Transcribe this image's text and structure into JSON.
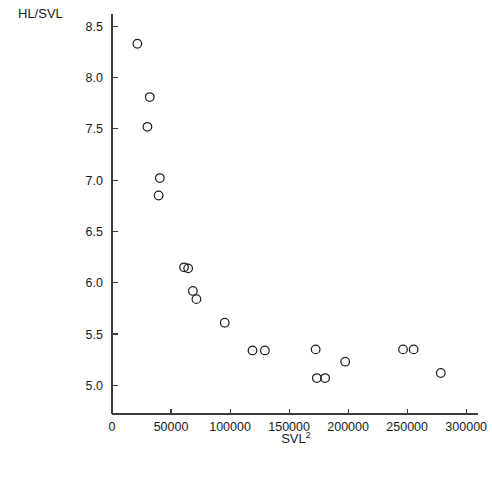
{
  "figure": {
    "background": "#ffffff",
    "ink_color": "#1f1f1f",
    "axis_color": "#3c3c3c"
  },
  "labels": {
    "y_axis_title": "HL/SVL",
    "x_axis_title_base": "SVL",
    "x_axis_title_exponent": "2"
  },
  "chart_data": {
    "type": "scatter",
    "title": "",
    "xlabel": "SVL2",
    "ylabel": "HL/SVL",
    "xlim": [
      0,
      310000
    ],
    "ylim": [
      4.72,
      8.62
    ],
    "grid": false,
    "legend": null,
    "marker": {
      "shape": "open-circle",
      "radius_px": 4.3,
      "fill": "none",
      "stroke": "#1f1f1f"
    },
    "xticks": [
      0,
      50000,
      100000,
      150000,
      200000,
      250000,
      300000
    ],
    "xtick_labels": [
      "0",
      "50000",
      "100000",
      "150000",
      "200000",
      "250000",
      "300000"
    ],
    "yticks": [
      5.0,
      5.5,
      6.0,
      6.5,
      7.0,
      7.5,
      8.0,
      8.5
    ],
    "ytick_labels": [
      "5.0",
      "5.5",
      "6.0",
      "6.5",
      "7.0",
      "7.5",
      "8.0",
      "8.5"
    ],
    "points": [
      {
        "x": 21500,
        "y": 8.33
      },
      {
        "x": 32000,
        "y": 7.81
      },
      {
        "x": 30000,
        "y": 7.52
      },
      {
        "x": 40500,
        "y": 7.02
      },
      {
        "x": 39500,
        "y": 6.85
      },
      {
        "x": 61000,
        "y": 6.15
      },
      {
        "x": 64500,
        "y": 6.14
      },
      {
        "x": 68500,
        "y": 5.92
      },
      {
        "x": 71500,
        "y": 5.84
      },
      {
        "x": 95500,
        "y": 5.61
      },
      {
        "x": 119000,
        "y": 5.34
      },
      {
        "x": 129500,
        "y": 5.34
      },
      {
        "x": 172500,
        "y": 5.35
      },
      {
        "x": 173500,
        "y": 5.07
      },
      {
        "x": 180500,
        "y": 5.07
      },
      {
        "x": 197500,
        "y": 5.23
      },
      {
        "x": 246500,
        "y": 5.35
      },
      {
        "x": 255500,
        "y": 5.35
      },
      {
        "x": 278500,
        "y": 5.12
      }
    ]
  },
  "geometry": {
    "plot_left_px": 112,
    "plot_bottom_px": 414,
    "plot_right_px": 478,
    "plot_top_px": 14,
    "x_per_unit_px": 0.001164,
    "y_per_unit_px": 103.2
  }
}
